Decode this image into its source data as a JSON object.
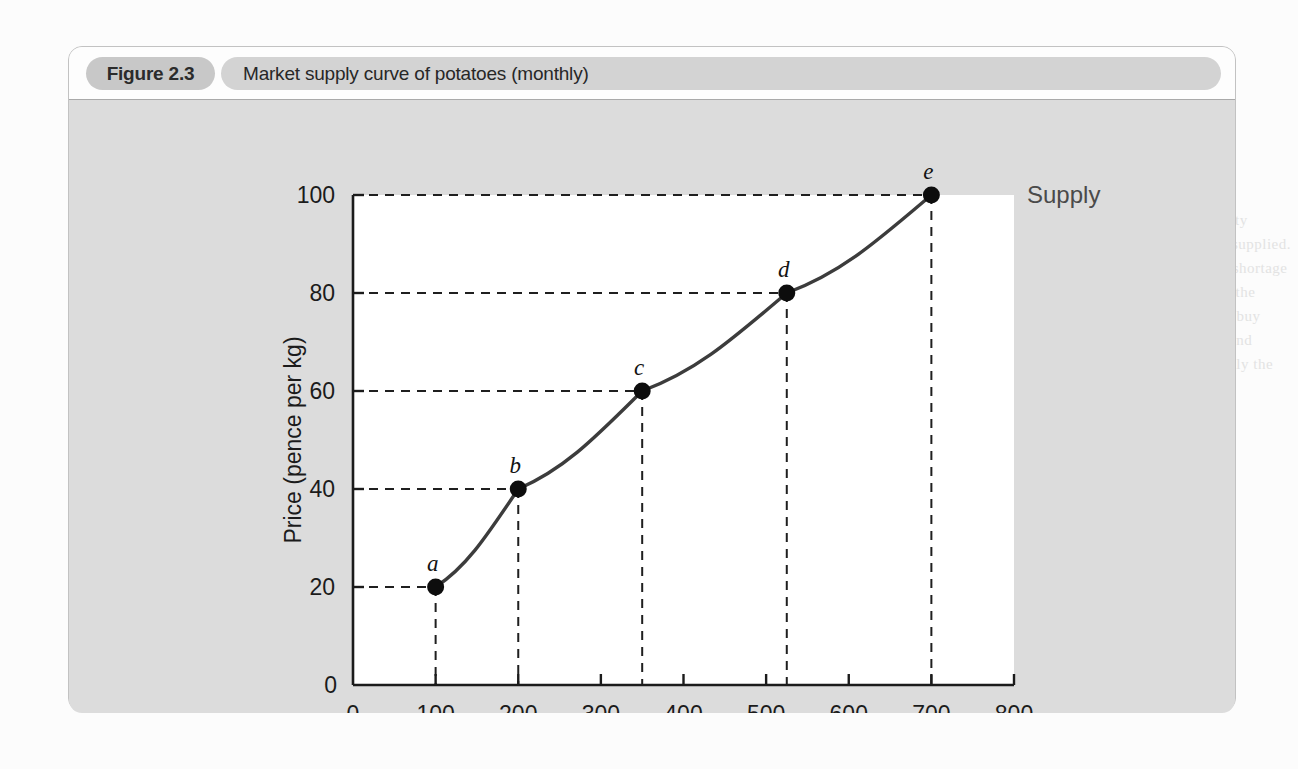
{
  "figure": {
    "number": "Figure 2.3",
    "title": "Market supply curve of potatoes (monthly)"
  },
  "colors": {
    "card_background": "#dcdcdc",
    "header_background": "#fdfdfd",
    "number_pill": "#c8c8c8",
    "title_pill": "#d3d3d3",
    "plot_background": "#ffffff",
    "axis": "#1b1b1b",
    "curve": "#3c3c3c",
    "point": "#0d0d0d",
    "gridline": "#1f1f1f"
  },
  "chart_data": {
    "type": "line",
    "title": "Market supply curve of potatoes (monthly)",
    "xlabel": "Quantity (tonnes: 000s)",
    "ylabel": "Price (pence per kg)",
    "xlim": [
      0,
      800
    ],
    "ylim": [
      0,
      100
    ],
    "xticks": [
      0,
      100,
      200,
      300,
      400,
      500,
      600,
      700,
      800
    ],
    "yticks": [
      0,
      20,
      40,
      60,
      80,
      100
    ],
    "grid": "dashed-guides-to-points",
    "legend": "inline-right-of-curve",
    "series": [
      {
        "name": "Supply",
        "label": "Supply",
        "points": [
          {
            "label": "a",
            "x": 100,
            "y": 20
          },
          {
            "label": "b",
            "x": 200,
            "y": 40
          },
          {
            "label": "c",
            "x": 350,
            "y": 60
          },
          {
            "label": "d",
            "x": 525,
            "y": 80
          },
          {
            "label": "e",
            "x": 700,
            "y": 100
          }
        ]
      }
    ],
    "x_tick_labels": [
      "0",
      "100",
      "200",
      "300",
      "400",
      "500",
      "600",
      "700",
      "800"
    ],
    "y_tick_labels": [
      "0",
      "20",
      "40",
      "60",
      "80",
      "100"
    ],
    "y_origin_label": "0",
    "x_origin_label": "0"
  },
  "ghost_text": {
    "right_heading": "Equilibrium price",
    "lines": [
      "the supply curve. This price gives the equi-",
      "librium point. The equilibrium price",
      "is the price at which the quantity",
      "demanded equals the quantity supplied.",
      "At this price there is neither a shortage",
      "nor a surplus of the product in the",
      "market. Consumers are able to buy",
      "exactly the amount they wish and",
      "producers are able to sell exactly the",
      "amount they wish at that price."
    ]
  }
}
